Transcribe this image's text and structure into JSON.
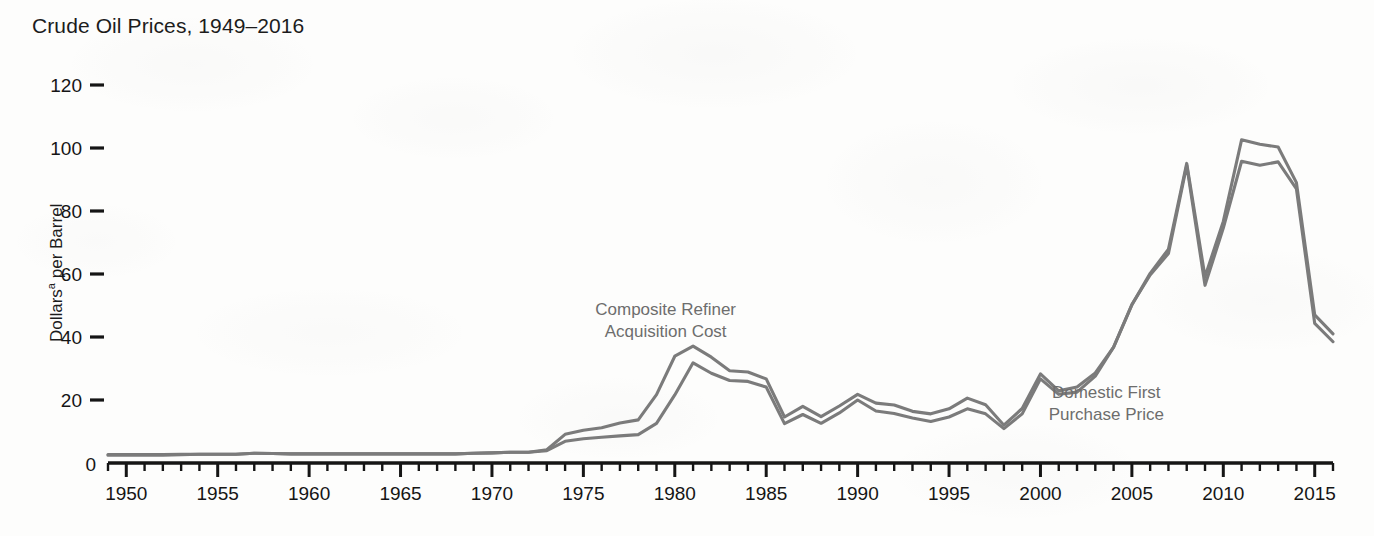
{
  "figure": {
    "title": "Crude Oil Prices, 1949–2016",
    "ylabel_main": "Dollars",
    "ylabel_sup": "a",
    "ylabel_rest": " per Barrel",
    "line_color": "#7b7b7b",
    "axis_color": "#151515",
    "annotation_color": "#6d6d6d",
    "background": "#fdfdfc"
  },
  "chart_data": {
    "type": "line",
    "title": "Crude Oil Prices, 1949–2016",
    "xlabel": "",
    "ylabel": "Dollars per Barrel",
    "xlim": [
      1949,
      2016
    ],
    "ylim": [
      0,
      128
    ],
    "grid": false,
    "legend": "annotations-on-plot",
    "y_ticks": [
      0,
      20,
      40,
      60,
      80,
      100,
      120
    ],
    "y_tick_labels": [
      "0",
      "20",
      "40",
      "60",
      "80",
      "100",
      "120"
    ],
    "x_ticks": [
      1950,
      1955,
      1960,
      1965,
      1970,
      1975,
      1980,
      1985,
      1990,
      1995,
      2000,
      2005,
      2010,
      2015
    ],
    "x_tick_labels": [
      "1950",
      "1955",
      "1960",
      "1965",
      "1970",
      "1975",
      "1980",
      "1985",
      "1990",
      "1995",
      "2000",
      "2005",
      "2010",
      "2015"
    ],
    "x_minor_tick_interval": 1,
    "annotations": [
      {
        "text_line1": "Composite Refiner",
        "text_line2": "Acquisition Cost",
        "x": 1979.5,
        "y": 47
      },
      {
        "text_line1": "Domestic First",
        "text_line2": "Purchase Price",
        "x": 2003.6,
        "y": 20.5
      }
    ],
    "x": [
      1949,
      1950,
      1951,
      1952,
      1953,
      1954,
      1955,
      1956,
      1957,
      1958,
      1959,
      1960,
      1961,
      1962,
      1963,
      1964,
      1965,
      1966,
      1967,
      1968,
      1969,
      1970,
      1971,
      1972,
      1973,
      1974,
      1975,
      1976,
      1977,
      1978,
      1979,
      1980,
      1981,
      1982,
      1983,
      1984,
      1985,
      1986,
      1987,
      1988,
      1989,
      1990,
      1991,
      1992,
      1993,
      1994,
      1995,
      1996,
      1997,
      1998,
      1999,
      2000,
      2001,
      2002,
      2003,
      2004,
      2005,
      2006,
      2007,
      2008,
      2009,
      2010,
      2011,
      2012,
      2013,
      2014,
      2015,
      2016
    ],
    "series": [
      {
        "name": "Composite Refiner Acquisition Cost",
        "values": [
          2.7,
          2.7,
          2.7,
          2.7,
          2.8,
          2.8,
          2.8,
          2.8,
          3.1,
          3.0,
          2.9,
          2.9,
          2.9,
          2.9,
          2.9,
          2.9,
          2.9,
          2.9,
          2.9,
          2.9,
          3.1,
          3.2,
          3.4,
          3.4,
          4.2,
          9.1,
          10.4,
          11.2,
          12.7,
          13.7,
          21.7,
          33.9,
          37.1,
          33.6,
          29.3,
          28.9,
          26.7,
          14.6,
          18.0,
          14.7,
          18.1,
          21.8,
          19.0,
          18.4,
          16.4,
          15.6,
          17.2,
          20.6,
          18.5,
          12.0,
          17.3,
          28.3,
          22.9,
          24.1,
          28.6,
          36.8,
          50.2,
          60.2,
          67.9,
          95.1,
          59.1,
          76.7,
          102.6,
          101.2,
          100.3,
          89.0,
          47.0,
          41.0
        ]
      },
      {
        "name": "Domestic First Purchase Price",
        "values": [
          2.5,
          2.5,
          2.5,
          2.5,
          2.6,
          2.8,
          2.8,
          2.8,
          3.1,
          3.0,
          2.9,
          2.9,
          2.9,
          2.9,
          2.9,
          2.9,
          2.9,
          2.9,
          2.9,
          2.9,
          3.1,
          3.2,
          3.4,
          3.4,
          3.9,
          6.9,
          7.7,
          8.2,
          8.6,
          9.0,
          12.6,
          21.6,
          31.8,
          28.5,
          26.2,
          25.9,
          24.1,
          12.5,
          15.4,
          12.6,
          15.9,
          20.0,
          16.5,
          15.7,
          14.3,
          13.2,
          14.6,
          17.2,
          15.6,
          10.9,
          15.6,
          26.7,
          21.8,
          22.5,
          27.6,
          36.8,
          50.3,
          59.7,
          66.5,
          94.5,
          56.4,
          74.6,
          95.8,
          94.5,
          95.6,
          87.0,
          44.3,
          38.5
        ]
      }
    ]
  }
}
